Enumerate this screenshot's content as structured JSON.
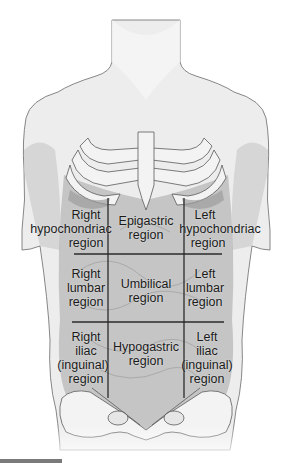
{
  "diagram": {
    "colors": {
      "skin": "#ececec",
      "skin_shadow": "#c9c9c9",
      "abdomen_fill": "#b9b9b9",
      "bone": "#f2f2f2",
      "outline": "#5a5a5a",
      "grid_line": "#2a2a2a",
      "text": "#1a1a1a",
      "bottom_bar": "#7a7a7a"
    },
    "grid": {
      "vertical_lines_x": [
        108,
        184
      ],
      "horizontal_lines_y": [
        254,
        322
      ],
      "top_y": 198,
      "bottom_y": 398
    },
    "regions": [
      {
        "id": "right-hypochondriac",
        "lines": [
          "Right",
          "hypochondriac",
          "region"
        ],
        "x": 86,
        "y": 208
      },
      {
        "id": "epigastric",
        "lines": [
          "Epigastric",
          "region"
        ],
        "x": 146,
        "y": 214
      },
      {
        "id": "left-hypochondriac",
        "lines": [
          "Left",
          "hypochondriac",
          "region"
        ],
        "x": 220,
        "y": 208
      },
      {
        "id": "right-lumbar",
        "lines": [
          "Right",
          "lumbar",
          "region"
        ],
        "x": 86,
        "y": 267
      },
      {
        "id": "umbilical",
        "lines": [
          "Umbilical",
          "region"
        ],
        "x": 146,
        "y": 277
      },
      {
        "id": "left-lumbar",
        "lines": [
          "Left",
          "lumbar",
          "region"
        ],
        "x": 205,
        "y": 267
      },
      {
        "id": "right-iliac-inguinal",
        "lines": [
          "Right",
          "iliac",
          "(inguinal)",
          "region"
        ],
        "x": 86,
        "y": 330
      },
      {
        "id": "hypogastric",
        "lines": [
          "Hypogastric",
          "region"
        ],
        "x": 146,
        "y": 340
      },
      {
        "id": "left-iliac-inguinal",
        "lines": [
          "Left",
          "iliac",
          "(inguinal)",
          "region"
        ],
        "x": 207,
        "y": 330
      }
    ]
  }
}
